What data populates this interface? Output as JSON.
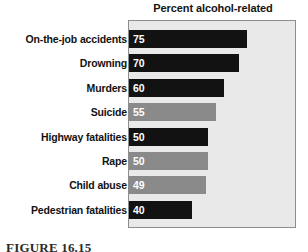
{
  "chart_data": {
    "type": "bar",
    "orientation": "horizontal",
    "title": "Percent alcohol-related",
    "xlabel": "",
    "ylabel": "",
    "xlim": [
      0,
      120
    ],
    "grid": false,
    "legend": null,
    "categories": [
      "On-the-job accidents",
      "Drowning",
      "Murders",
      "Suicide",
      "Highway fatalities",
      "Rape",
      "Child abuse",
      "Pedestrian fatalities"
    ],
    "values": [
      75,
      70,
      60,
      55,
      50,
      50,
      49,
      40
    ],
    "value_labels": [
      "75",
      "70",
      "60",
      "55",
      "50",
      "50",
      "49",
      "40"
    ],
    "bar_colors": [
      "#121212",
      "#121212",
      "#121212",
      "#8a8a8a",
      "#121212",
      "#8a8a8a",
      "#8a8a8a",
      "#121212"
    ],
    "plot_background": "#e9e9e9",
    "frame_color": "#8d8d8d",
    "value_label_color": "#ffffff"
  },
  "caption": {
    "text": "FIGURE 16.15"
  }
}
